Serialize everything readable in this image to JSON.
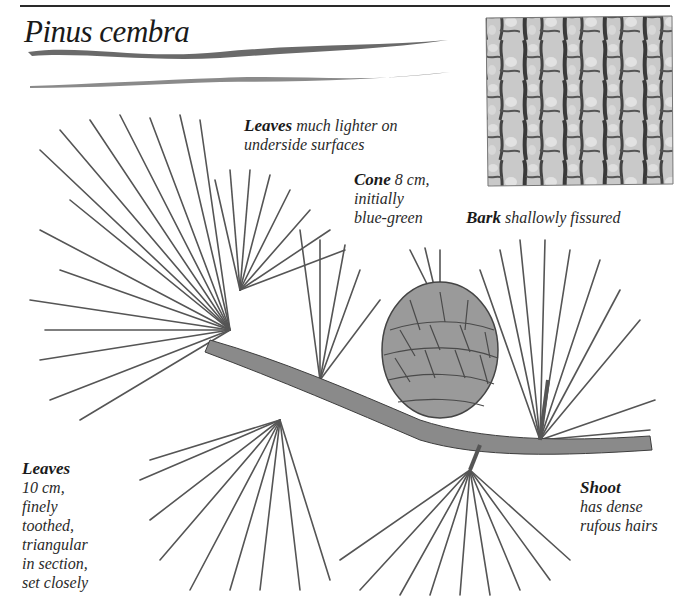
{
  "page": {
    "title": "Pinus cembra"
  },
  "captions": {
    "leaves_upper": {
      "bold": "Leaves",
      "text": "much lighter on underside surfaces",
      "line1": "much lighter on",
      "line2": "underside surfaces"
    },
    "cone": {
      "bold": "Cone",
      "line1": "8 cm,",
      "line2": "initially",
      "line3": "blue-green"
    },
    "bark": {
      "bold": "Bark",
      "text": "shallowly fissured"
    },
    "leaves_lower": {
      "bold": "Leaves",
      "lines": [
        "10 cm,",
        "finely",
        "toothed,",
        "triangular",
        "in section,",
        "set closely"
      ]
    },
    "shoot": {
      "bold": "Shoot",
      "line1": "has dense",
      "line2": "rufous hairs"
    }
  },
  "illustrations": {
    "bark": "bark-texture-illustration",
    "branch": "pine-branch-illustration",
    "cone": "pine-cone-illustration"
  },
  "colors": {
    "ink": "#1e1e1e",
    "needle": "#555555",
    "bark_light": "#c8c8c8",
    "bark_dark": "#3a3a3a"
  }
}
